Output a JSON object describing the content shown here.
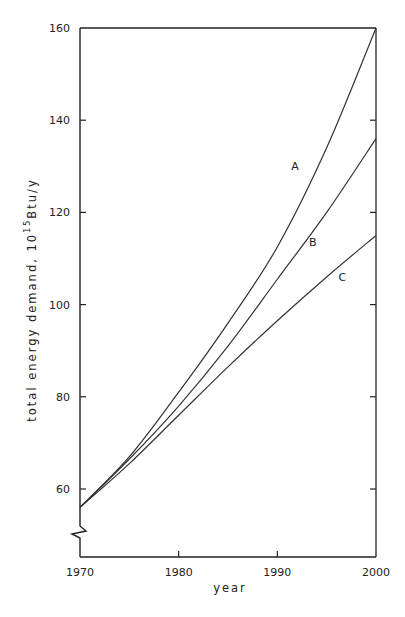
{
  "chart_data": {
    "type": "line",
    "title": "",
    "xlabel": "year",
    "ylabel_main": "total energy demand, 10",
    "ylabel_sup": "15",
    "ylabel_unit": "Btu/y",
    "xlim": [
      1970,
      2000
    ],
    "ylim": [
      60,
      160
    ],
    "y_axis_break": true,
    "grid": false,
    "legend": "inline labels",
    "x_ticks": [
      1970,
      1980,
      1990,
      2000
    ],
    "x_tick_labels": [
      "1970",
      "1980",
      "1990",
      "2000"
    ],
    "y_ticks": [
      60,
      80,
      100,
      120,
      140,
      160
    ],
    "y_tick_labels": [
      "60",
      "80",
      "100",
      "120",
      "140",
      "160"
    ],
    "x": [
      1970,
      1975,
      1980,
      1985,
      1990,
      1995,
      2000
    ],
    "series": [
      {
        "name": "A",
        "values": [
          56,
          67,
          81,
          96,
          112.5,
          134,
          160
        ],
        "label_at": [
          1991.8,
          130
        ]
      },
      {
        "name": "B",
        "values": [
          56,
          66.5,
          78,
          91,
          105.5,
          120,
          136
        ],
        "label_at": [
          1993.6,
          113.5
        ]
      },
      {
        "name": "C",
        "values": [
          56,
          65.5,
          76,
          86.5,
          96.5,
          106,
          115
        ],
        "label_at": [
          1996.6,
          106
        ]
      }
    ]
  }
}
